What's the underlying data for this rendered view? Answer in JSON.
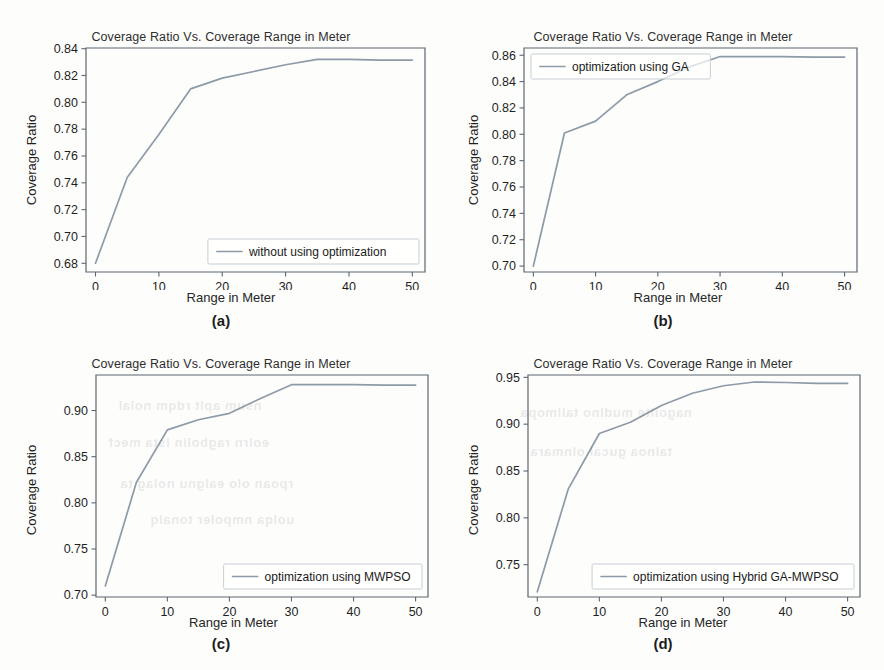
{
  "page": {
    "background_color": "#fdfdfc",
    "line_color": "#8d9aa8",
    "axis_color": "#5d6671",
    "text_color": "#1f1f1f"
  },
  "figures": [
    {
      "id": "a",
      "caption": "(a)",
      "caption_letter": "a",
      "chart_data": {
        "type": "line",
        "title": "Coverage Ratio Vs. Coverage Range in Meter",
        "xlabel": "Range in Meter",
        "ylabel": "Coverage Ratio",
        "xlim": [
          -1.5,
          52
        ],
        "ylim": [
          0.6735,
          0.8405
        ],
        "xticks": [
          0,
          10,
          20,
          30,
          40,
          50
        ],
        "xticklabels": [
          "0",
          "10",
          "20",
          "30",
          "40",
          "50"
        ],
        "yticks": [
          0.68,
          0.7,
          0.72,
          0.74,
          0.76,
          0.78,
          0.8,
          0.82,
          0.84
        ],
        "yticklabels": [
          "0.68",
          "0.70",
          "0.72",
          "0.74",
          "0.76",
          "0.78",
          "0.80",
          "0.82",
          "0.84"
        ],
        "grid": false,
        "legend_position": "lower right",
        "series": [
          {
            "name": "without using optimization",
            "x": [
              0,
              5,
              10,
              15,
              20,
              25,
              30,
              35,
              40,
              45,
              50
            ],
            "values": [
              0.68,
              0.744,
              0.776,
              0.81,
              0.818,
              0.823,
              0.828,
              0.832,
              0.832,
              0.8315,
              0.8315
            ]
          }
        ]
      }
    },
    {
      "id": "b",
      "caption": "(b)",
      "caption_letter": "b",
      "chart_data": {
        "type": "line",
        "title": "Coverage Ratio Vs. Coverage Range in Meter",
        "xlabel": "Range in Meter",
        "ylabel": "Coverage Ratio",
        "xlim": [
          -1.5,
          52
        ],
        "ylim": [
          0.6955,
          0.8655
        ],
        "xticks": [
          0,
          10,
          20,
          30,
          40,
          50
        ],
        "xticklabels": [
          "0",
          "10",
          "20",
          "30",
          "40",
          "50"
        ],
        "yticks": [
          0.7,
          0.72,
          0.74,
          0.76,
          0.78,
          0.8,
          0.82,
          0.84,
          0.86
        ],
        "yticklabels": [
          "0.70",
          "0.72",
          "0.74",
          "0.76",
          "0.78",
          "0.80",
          "0.82",
          "0.84",
          "0.86"
        ],
        "grid": false,
        "legend_position": "upper left",
        "series": [
          {
            "name": "optimization using GA",
            "x": [
              0,
              5,
              10,
              15,
              20,
              25,
              30,
              35,
              40,
              45,
              50
            ],
            "values": [
              0.7,
              0.801,
              0.81,
              0.83,
              0.84,
              0.851,
              0.859,
              0.859,
              0.859,
              0.8585,
              0.8585
            ]
          }
        ]
      }
    },
    {
      "id": "c",
      "caption": "(c)",
      "caption_letter": "c",
      "chart_data": {
        "type": "line",
        "title": "Coverage Ratio Vs. Coverage Range in Meter",
        "xlabel": "Range in Meter",
        "ylabel": "Coverage Ratio",
        "xlim": [
          -1.5,
          52
        ],
        "ylim": [
          0.698,
          0.9385
        ],
        "xticks": [
          0,
          10,
          20,
          30,
          40,
          50
        ],
        "xticklabels": [
          "0",
          "10",
          "20",
          "30",
          "40",
          "50"
        ],
        "yticks": [
          0.7,
          0.75,
          0.8,
          0.85,
          0.9
        ],
        "yticklabels": [
          "0.70",
          "0.75",
          "0.80",
          "0.85",
          "0.90"
        ],
        "grid": false,
        "legend_position": "lower right",
        "series": [
          {
            "name": "optimization using MWPSO",
            "x": [
              0,
              5,
              10,
              15,
              20,
              25,
              30,
              35,
              40,
              45,
              50
            ],
            "values": [
              0.71,
              0.822,
              0.879,
              0.89,
              0.897,
              0.913,
              0.928,
              0.928,
              0.928,
              0.9275,
              0.9275
            ]
          }
        ]
      }
    },
    {
      "id": "d",
      "caption": "(d)",
      "caption_letter": "d",
      "chart_data": {
        "type": "line",
        "title": "Coverage Ratio Vs. Coverage Range in Meter",
        "xlabel": "Range in Meter",
        "ylabel": "Coverage Ratio",
        "xlim": [
          -1.5,
          52
        ],
        "ylim": [
          0.7155,
          0.9525
        ],
        "xticks": [
          0,
          10,
          20,
          30,
          40,
          50
        ],
        "xticklabels": [
          "0",
          "10",
          "20",
          "30",
          "40",
          "50"
        ],
        "yticks": [
          0.75,
          0.8,
          0.85,
          0.9,
          0.95
        ],
        "yticklabels": [
          "0.75",
          "0.80",
          "0.85",
          "0.90",
          "0.95"
        ],
        "grid": false,
        "legend_position": "lower right",
        "series": [
          {
            "name": "optimization using Hybrid GA-MWPSO",
            "x": [
              0,
              5,
              10,
              15,
              20,
              25,
              30,
              35,
              40,
              45,
              50
            ],
            "values": [
              0.721,
              0.831,
              0.89,
              0.902,
              0.92,
              0.933,
              0.941,
              0.945,
              0.9445,
              0.9435,
              0.9435
            ]
          }
        ]
      }
    }
  ],
  "bleedthrough": [
    {
      "text": "nsum aplt rdqm nolal",
      "x": 118,
      "y": 398
    },
    {
      "text": "eolrn ragbolin lsta mecf",
      "x": 108,
      "y": 435
    },
    {
      "text": "rpoan olo ealgnu nolag ta",
      "x": 120,
      "y": 476
    },
    {
      "text": "uolqa nmpoler tonalq",
      "x": 150,
      "y": 512
    },
    {
      "text": "nagoilte mudlno tallmopa",
      "x": 520,
      "y": 405
    },
    {
      "text": "talnoa gucal olnmara",
      "x": 530,
      "y": 444
    }
  ]
}
